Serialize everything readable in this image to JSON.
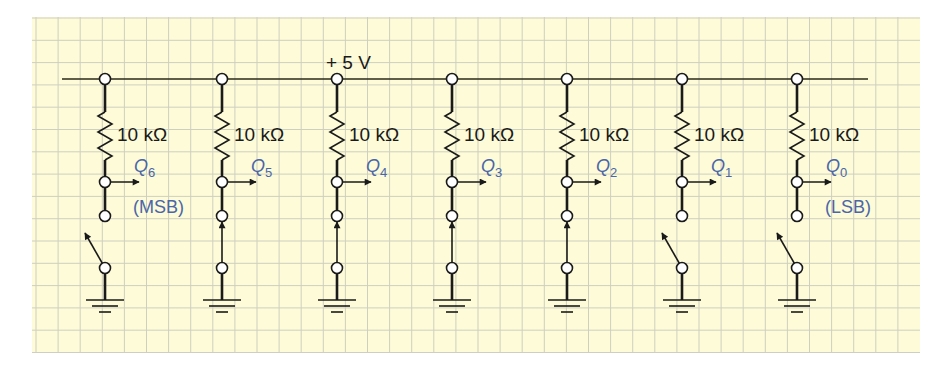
{
  "colors": {
    "paper": "#fdfbd8",
    "grid": "#cfcfbf",
    "wire": "#1a1a1a",
    "label_blue": "#4a66a8"
  },
  "supply": {
    "label": "+ 5 V"
  },
  "resistor_value": "10 kΩ",
  "bits": [
    {
      "q": "Q",
      "sub": "6",
      "resistor": "10 kΩ",
      "switch": "open",
      "tag": "(MSB)"
    },
    {
      "q": "Q",
      "sub": "5",
      "resistor": "10 kΩ",
      "switch": "closed",
      "tag": ""
    },
    {
      "q": "Q",
      "sub": "4",
      "resistor": "10 kΩ",
      "switch": "closed",
      "tag": ""
    },
    {
      "q": "Q",
      "sub": "3",
      "resistor": "10 kΩ",
      "switch": "closed",
      "tag": ""
    },
    {
      "q": "Q",
      "sub": "2",
      "resistor": "10 kΩ",
      "switch": "closed",
      "tag": ""
    },
    {
      "q": "Q",
      "sub": "1",
      "resistor": "10 kΩ",
      "switch": "open",
      "tag": ""
    },
    {
      "q": "Q",
      "sub": "0",
      "resistor": "10 kΩ",
      "switch": "open",
      "tag": "(LSB)"
    }
  ]
}
